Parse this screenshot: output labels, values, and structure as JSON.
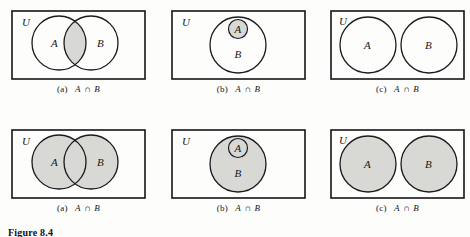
{
  "figure": {
    "label": "Figure 8.4",
    "universe_label": "U",
    "set_a_label": "A",
    "set_b_label": "B"
  },
  "style": {
    "shade_color": "#d8d8d4",
    "stroke_color": "#1b1b1f",
    "rect_stroke_color": "#15151a",
    "background": "#fdfdfc"
  },
  "panels": [
    {
      "id": "top-a",
      "caption_index": "(a)",
      "caption_expr": "A ∩ B",
      "caption_left": "A",
      "caption_op": "∩",
      "caption_right": "B",
      "universe_label": "U",
      "layout": "overlapping",
      "shaded_region": "intersection",
      "labels": {
        "a": "A",
        "b": "B"
      }
    },
    {
      "id": "top-b",
      "caption_index": "(b)",
      "caption_expr": "A ∩ B",
      "caption_left": "A",
      "caption_op": "∩",
      "caption_right": "B",
      "universe_label": "U",
      "layout": "subset",
      "shaded_region": "a-only",
      "labels": {
        "a": "A",
        "b": "B"
      }
    },
    {
      "id": "top-c",
      "caption_index": "(c)",
      "caption_expr": "A ∩ B",
      "caption_left": "A",
      "caption_op": "∩",
      "caption_right": "B",
      "universe_label": "U",
      "layout": "disjoint",
      "shaded_region": "none",
      "labels": {
        "a": "A",
        "b": "B"
      }
    },
    {
      "id": "bottom-a",
      "caption_index": "(a)",
      "caption_expr": "A ∩ B",
      "caption_left": "A",
      "caption_op": "∩",
      "caption_right": "B",
      "universe_label": "U",
      "layout": "overlapping",
      "shaded_region": "both-circles",
      "labels": {
        "a": "A",
        "b": "B"
      }
    },
    {
      "id": "bottom-b",
      "caption_index": "(b)",
      "caption_expr": "A ∩ B",
      "caption_left": "A",
      "caption_op": "∩",
      "caption_right": "B",
      "universe_label": "U",
      "layout": "subset",
      "shaded_region": "b-circle",
      "labels": {
        "a": "A",
        "b": "B"
      }
    },
    {
      "id": "bottom-c",
      "caption_index": "(c)",
      "caption_expr": "A ∩ B",
      "caption_left": "A",
      "caption_op": "∩",
      "caption_right": "B",
      "universe_label": "U",
      "layout": "disjoint",
      "shaded_region": "both-circles",
      "labels": {
        "a": "A",
        "b": "B"
      }
    }
  ]
}
